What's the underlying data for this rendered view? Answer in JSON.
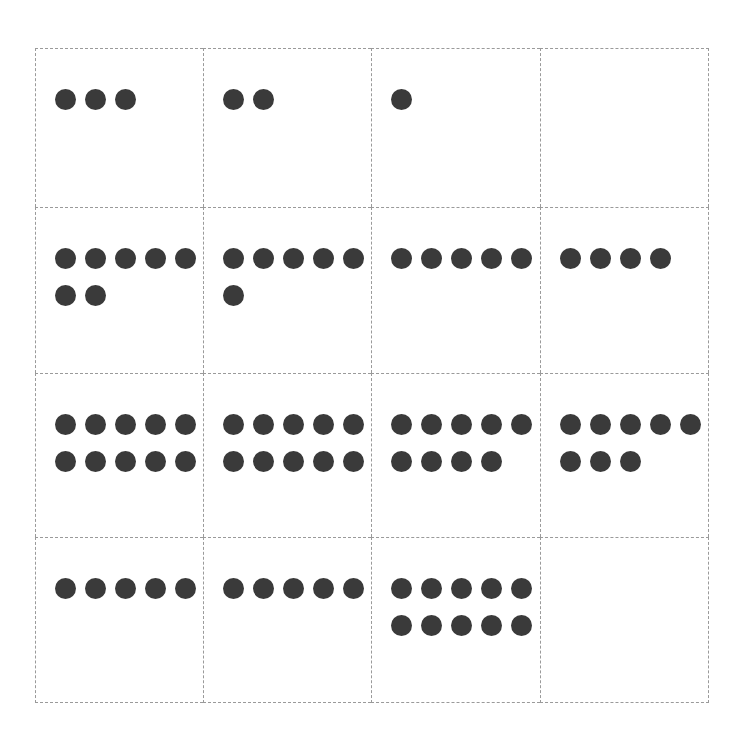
{
  "figure": {
    "name": "dot-count-grid",
    "dot_color": "#3a3a3a",
    "grid_line_color": "#9a9a9a",
    "background_color": "#ffffff",
    "rows": 4,
    "columns": 4,
    "dots_per_row_max": 5,
    "dot_diameter_px": 21
  },
  "chart_data": {
    "type": "table",
    "title": "",
    "xlabel": "",
    "ylabel": "",
    "grid": true,
    "legend": null,
    "categories": [
      "Column 1",
      "Column 2",
      "Column 3",
      "Column 4"
    ],
    "row_labels": [
      "Row 1",
      "Row 2",
      "Row 3",
      "Row 4"
    ],
    "series": [
      {
        "name": "Row 1",
        "values": [
          3,
          2,
          1,
          0
        ]
      },
      {
        "name": "Row 2",
        "values": [
          7,
          6,
          5,
          4
        ]
      },
      {
        "name": "Row 3",
        "values": [
          10,
          10,
          9,
          8
        ]
      },
      {
        "name": "Row 4",
        "values": [
          5,
          5,
          10,
          0
        ]
      }
    ]
  },
  "cells": [
    {
      "id": "r1c1",
      "row": 1,
      "col": 1,
      "count": 3,
      "lines": [
        3
      ]
    },
    {
      "id": "r1c2",
      "row": 1,
      "col": 2,
      "count": 2,
      "lines": [
        2
      ]
    },
    {
      "id": "r1c3",
      "row": 1,
      "col": 3,
      "count": 1,
      "lines": [
        1
      ]
    },
    {
      "id": "r1c4",
      "row": 1,
      "col": 4,
      "count": 0,
      "lines": []
    },
    {
      "id": "r2c1",
      "row": 2,
      "col": 1,
      "count": 7,
      "lines": [
        5,
        2
      ]
    },
    {
      "id": "r2c2",
      "row": 2,
      "col": 2,
      "count": 6,
      "lines": [
        5,
        1
      ]
    },
    {
      "id": "r2c3",
      "row": 2,
      "col": 3,
      "count": 5,
      "lines": [
        5
      ]
    },
    {
      "id": "r2c4",
      "row": 2,
      "col": 4,
      "count": 4,
      "lines": [
        4
      ]
    },
    {
      "id": "r3c1",
      "row": 3,
      "col": 1,
      "count": 10,
      "lines": [
        5,
        5
      ]
    },
    {
      "id": "r3c2",
      "row": 3,
      "col": 2,
      "count": 10,
      "lines": [
        5,
        5
      ]
    },
    {
      "id": "r3c3",
      "row": 3,
      "col": 3,
      "count": 9,
      "lines": [
        5,
        4
      ]
    },
    {
      "id": "r3c4",
      "row": 3,
      "col": 4,
      "count": 8,
      "lines": [
        5,
        3
      ]
    },
    {
      "id": "r4c1",
      "row": 4,
      "col": 1,
      "count": 5,
      "lines": [
        5
      ]
    },
    {
      "id": "r4c2",
      "row": 4,
      "col": 2,
      "count": 5,
      "lines": [
        5
      ]
    },
    {
      "id": "r4c3",
      "row": 4,
      "col": 3,
      "count": 10,
      "lines": [
        5,
        5
      ]
    },
    {
      "id": "r4c4",
      "row": 4,
      "col": 4,
      "count": 0,
      "lines": []
    }
  ]
}
